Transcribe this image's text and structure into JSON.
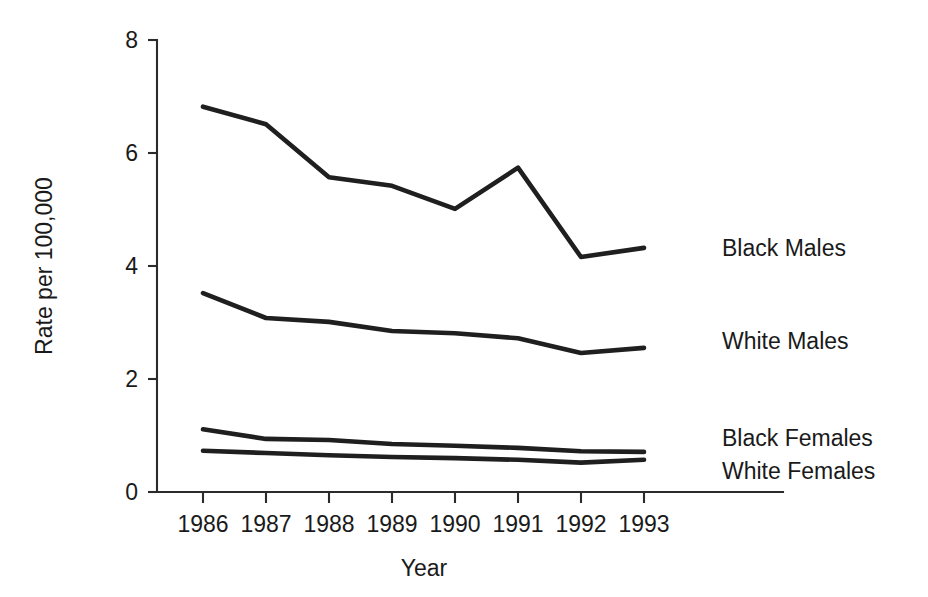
{
  "chart_data": {
    "type": "line",
    "title": "",
    "xlabel": "Year",
    "ylabel": "Rate per 100,000",
    "categories": [
      1986,
      1987,
      1988,
      1989,
      1990,
      1991,
      1992,
      1993
    ],
    "x_tick_labels": [
      "1986",
      "1987",
      "1988",
      "1989",
      "1990",
      "1991",
      "1992",
      "1993"
    ],
    "y_tick_labels": [
      "0",
      "2",
      "4",
      "6",
      "8"
    ],
    "y_ticks": [
      0,
      2,
      4,
      6,
      8
    ],
    "ylim": [
      0,
      8
    ],
    "xlim": [
      1986,
      1993
    ],
    "grid": false,
    "legend_position": "right-inline-labels",
    "series": [
      {
        "name": "Black Males",
        "label": "Black Males",
        "color": "#1f1f1f",
        "values": [
          6.82,
          6.51,
          5.57,
          5.42,
          5.01,
          5.74,
          4.16,
          4.32
        ]
      },
      {
        "name": "White Males",
        "label": "White Males",
        "color": "#1f1f1f",
        "values": [
          3.52,
          3.08,
          3.01,
          2.85,
          2.81,
          2.72,
          2.46,
          2.55
        ]
      },
      {
        "name": "Black Females",
        "label": "Black Females",
        "color": "#1f1f1f",
        "values": [
          1.11,
          0.94,
          0.92,
          0.85,
          0.82,
          0.78,
          0.72,
          0.71
        ]
      },
      {
        "name": "White Females",
        "label": "White Females",
        "color": "#1f1f1f",
        "values": [
          0.73,
          0.69,
          0.65,
          0.62,
          0.6,
          0.57,
          0.52,
          0.57
        ]
      }
    ]
  },
  "axes": {
    "y_title": "Rate per 100,000",
    "x_title": "Year"
  },
  "series_labels": {
    "black_males": "Black Males",
    "white_males": "White Males",
    "black_females": "Black Females",
    "white_females": "White Females"
  },
  "colors": {
    "line": "#1f1f1f",
    "axis": "#2b2b2b",
    "background": "#ffffff",
    "text": "#1a1a1a"
  }
}
